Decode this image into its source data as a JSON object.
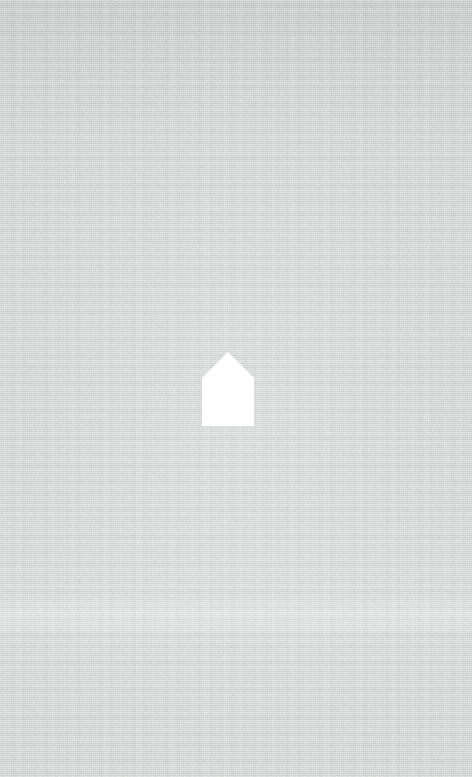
{
  "canvas": {
    "width": 472,
    "height": 777,
    "background_color": "#d2d4d3",
    "background_highlight_color": "#d8dad9",
    "background_shadow_color": "#cbcdcc",
    "texture": "woven-linen-canvas"
  },
  "logo": {
    "icon_name": "home-icon",
    "shape": "house-pentagon",
    "color": "#ffffff",
    "alt_text": "Home",
    "position": {
      "left": 200,
      "top": 350,
      "width": 56,
      "height": 78
    },
    "geometry": {
      "apex_x": 28,
      "apex_y": 2,
      "eave_y": 28,
      "left_x": 2,
      "right_x": 54,
      "base_y": 76
    }
  }
}
